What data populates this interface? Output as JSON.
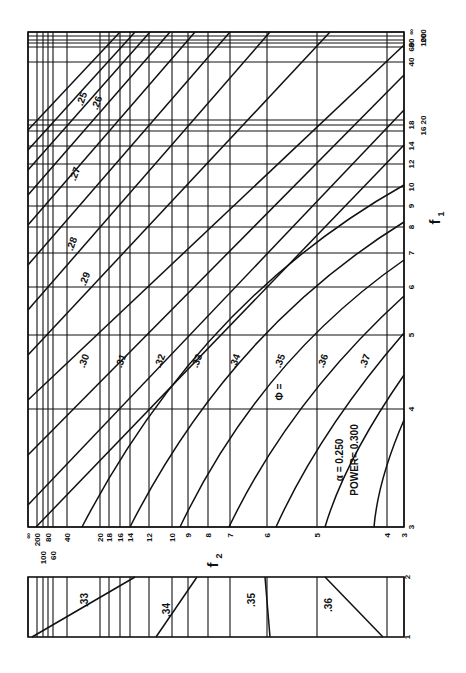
{
  "chart_data": {
    "type": "line",
    "title": "",
    "annotation": {
      "alpha_label": "α = 0.250",
      "power_label": "POWER= 0.300"
    },
    "xlabel": "f2",
    "ylabel": "f1",
    "phi_prefix": "Φ =",
    "main_panel": {
      "f2_ticks": [
        "∞",
        "200",
        "100",
        "80",
        "60",
        "40",
        "20",
        "18",
        "16",
        "14",
        "12",
        "10",
        "9",
        "8",
        "7",
        "6",
        "5",
        "4",
        "3"
      ],
      "f2_pos": [
        28,
        37,
        43,
        48,
        53,
        67,
        100,
        109,
        120,
        130,
        149,
        172,
        188,
        208,
        230,
        267,
        317,
        387,
        404
      ],
      "f1_ticks": [
        "∞",
        "200",
        "100",
        "80",
        "60",
        "40",
        "20",
        "18",
        "16",
        "14",
        "12",
        "10",
        "9",
        "8",
        "7",
        "6",
        "5",
        "4",
        "3"
      ],
      "f1_pos": [
        32,
        36,
        40,
        43,
        47,
        62,
        120,
        125,
        131,
        146,
        164,
        187,
        206,
        227,
        253,
        287,
        335,
        409,
        527
      ],
      "curves": [
        {
          "phi": ".25",
          "label_shown": true
        },
        {
          "phi": ".26",
          "label_shown": true
        },
        {
          "phi": ".27",
          "label_shown": true
        },
        {
          "phi": ".28",
          "label_shown": true
        },
        {
          "phi": ".29",
          "label_shown": true
        },
        {
          "phi": ".30",
          "label_shown": true
        },
        {
          "phi": ".31",
          "label_shown": true
        },
        {
          "phi": ".32",
          "label_shown": true
        },
        {
          "phi": ".33",
          "label_shown": true
        },
        {
          "phi": ".34",
          "label_shown": true
        },
        {
          "phi": ".35",
          "label_shown": true
        },
        {
          "phi": ".36",
          "label_shown": true
        },
        {
          "phi": ".37",
          "label_shown": true
        }
      ]
    },
    "inset_panel": {
      "f1_range": [
        "1",
        "2"
      ],
      "curves": [
        {
          "phi": ".33"
        },
        {
          "phi": ".34"
        },
        {
          "phi": ".35"
        },
        {
          "phi": ".36"
        }
      ]
    }
  }
}
